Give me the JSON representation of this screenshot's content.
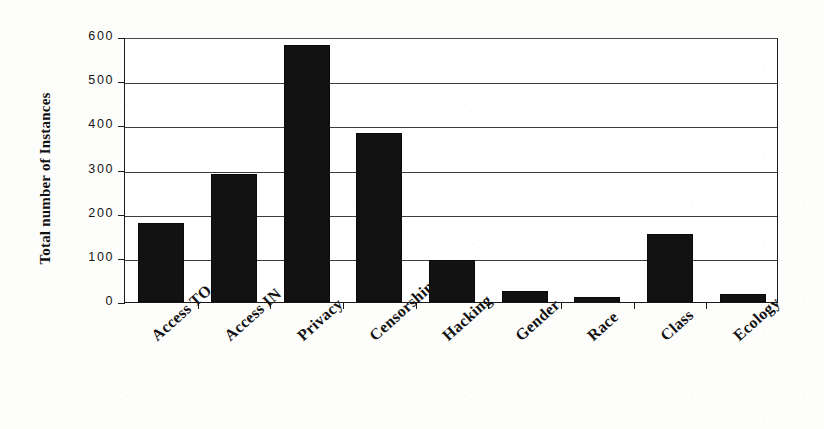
{
  "chart_data": {
    "type": "bar",
    "title": "",
    "subtitle": "",
    "xlabel": "",
    "ylabel": "Total number of Instances",
    "categories": [
      "Access TO",
      "Access IN",
      "Privacy",
      "Censorship",
      "Hacking",
      "Gender",
      "Race",
      "Class",
      "Ecology"
    ],
    "values": [
      180,
      290,
      583,
      382,
      95,
      25,
      12,
      155,
      18
    ],
    "ylim": [
      0,
      600
    ],
    "ytick_labels": [
      "0",
      "100",
      "200",
      "300",
      "400",
      "500",
      "600"
    ],
    "ytick_values": [
      0,
      100,
      200,
      300,
      400,
      500,
      600
    ],
    "grid": "horizontal",
    "legend": "none",
    "bar_color": "#121212",
    "axis_color": "#1a1a1a",
    "background_color": "#ffffff"
  },
  "axis": {
    "y_title": "Total number of Instances"
  }
}
